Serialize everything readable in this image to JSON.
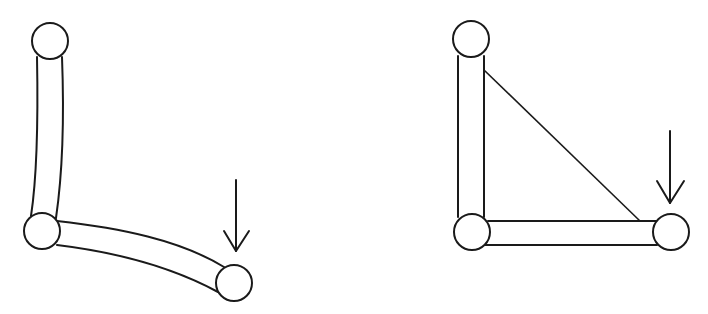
{
  "diagram": {
    "colors": {
      "line": "#1a1a1a",
      "background": "#ffffff",
      "joint_fill": "#ffffff"
    },
    "figures": [
      {
        "id": "left",
        "label": "L-shaped frame (deformed, bending)",
        "joints": [
          {
            "name": "top",
            "cx": 50,
            "cy": 41,
            "r": 18
          },
          {
            "name": "corner",
            "cx": 42,
            "cy": 231,
            "r": 18
          },
          {
            "name": "free-end",
            "cx": 234,
            "cy": 283,
            "r": 18
          }
        ],
        "members": [
          "vertical-beam-curved",
          "horizontal-beam-curved"
        ],
        "load": {
          "type": "arrow-down",
          "x": 236,
          "y_start": 180,
          "y_end": 251
        }
      },
      {
        "id": "right",
        "label": "Braced frame (triangulated with diagonal)",
        "joints": [
          {
            "name": "top",
            "cx": 471,
            "cy": 39,
            "r": 18
          },
          {
            "name": "corner",
            "cx": 472,
            "cy": 232,
            "r": 18
          },
          {
            "name": "free-end",
            "cx": 671,
            "cy": 232,
            "r": 18
          }
        ],
        "members": [
          "vertical-beam",
          "horizontal-beam",
          "diagonal-brace"
        ],
        "load": {
          "type": "arrow-down",
          "x": 670,
          "y_start": 131,
          "y_end": 203
        }
      }
    ]
  }
}
